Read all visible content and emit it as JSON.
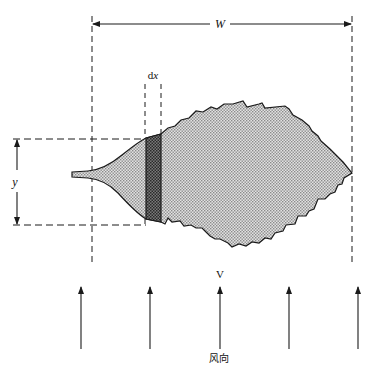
{
  "diagram": {
    "type": "leaf-in-wind-schematic",
    "labels": {
      "width": "W",
      "strip_width": "dx",
      "strip_width_d": "d",
      "strip_width_x": "x",
      "height": "y",
      "velocity": "V",
      "wind_direction": "风向"
    },
    "colors": {
      "line": "#1a1a1a",
      "leaf_fill": "#c8c8c8",
      "strip_fill": "#6e6e6e",
      "background": "#ffffff"
    },
    "wind_arrow_count": 5
  }
}
